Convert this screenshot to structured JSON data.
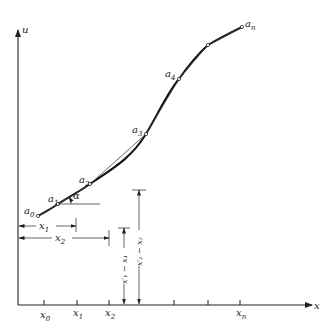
{
  "figure": {
    "axes": {
      "y_label": "u",
      "x_label": "x"
    },
    "points": [
      {
        "name": "a",
        "sub": "0",
        "x": 38,
        "y": 216
      },
      {
        "name": "a",
        "sub": "1",
        "x": 58,
        "y": 204
      },
      {
        "name": "a",
        "sub": "2",
        "x": 90,
        "y": 184
      },
      {
        "name": "a",
        "sub": "3",
        "x": 146,
        "y": 134
      },
      {
        "name": "a",
        "sub": "4",
        "x": 179,
        "y": 79
      },
      {
        "name": "",
        "sub": "",
        "x": 208,
        "y": 45
      },
      {
        "name": "a",
        "sub": "n",
        "x": 242,
        "y": 27
      }
    ],
    "angle_label": "α",
    "x_ticks": [
      {
        "label": "x",
        "sub": "0",
        "x": 44
      },
      {
        "label": "x",
        "sub": "1",
        "x": 77
      },
      {
        "label": "x",
        "sub": "2",
        "x": 109
      },
      {
        "label": "",
        "sub": "",
        "x": 124
      },
      {
        "label": "",
        "sub": "",
        "x": 139
      },
      {
        "label": "",
        "sub": "",
        "x": 174
      },
      {
        "label": "",
        "sub": "",
        "x": 208
      },
      {
        "label": "x",
        "sub": "n",
        "x": 240
      }
    ],
    "dimensions": {
      "x1": {
        "label": "x",
        "sub": "1"
      },
      "x2": {
        "label": "x",
        "sub": "2"
      },
      "diff1": "x′₁ − x₁",
      "diff2": "x′₂ − x₂"
    }
  }
}
